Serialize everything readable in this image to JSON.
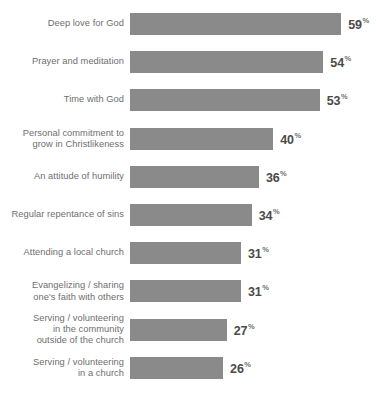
{
  "chart_data": {
    "type": "bar",
    "orientation": "horizontal",
    "title": "",
    "subtitle": "",
    "xlabel": "",
    "ylabel": "",
    "grid": false,
    "legend": null,
    "value_suffix": "%",
    "xlim": [
      0,
      59
    ],
    "categories": [
      "Deep love for God",
      "Prayer and meditation",
      "Time with God",
      "Personal commitment to\ngrow in Christlikeness",
      "An attitude of humility",
      "Regular repentance of sins",
      "Attending a local church",
      "Evangelizing / sharing\none's faith with others",
      "Serving / volunteering\nin the community\noutside of the church",
      "Serving / volunteering\nin a church"
    ],
    "values": [
      59,
      54,
      53,
      40,
      36,
      34,
      31,
      31,
      27,
      26
    ],
    "value_labels": [
      "59",
      "54",
      "53",
      "40",
      "36",
      "34",
      "31",
      "31",
      "27",
      "26"
    ],
    "colors": {
      "bar": "#8a8a8a",
      "category_text": "#6e6e6e",
      "value_text": "#4a4a4a",
      "background": "#ffffff"
    }
  }
}
